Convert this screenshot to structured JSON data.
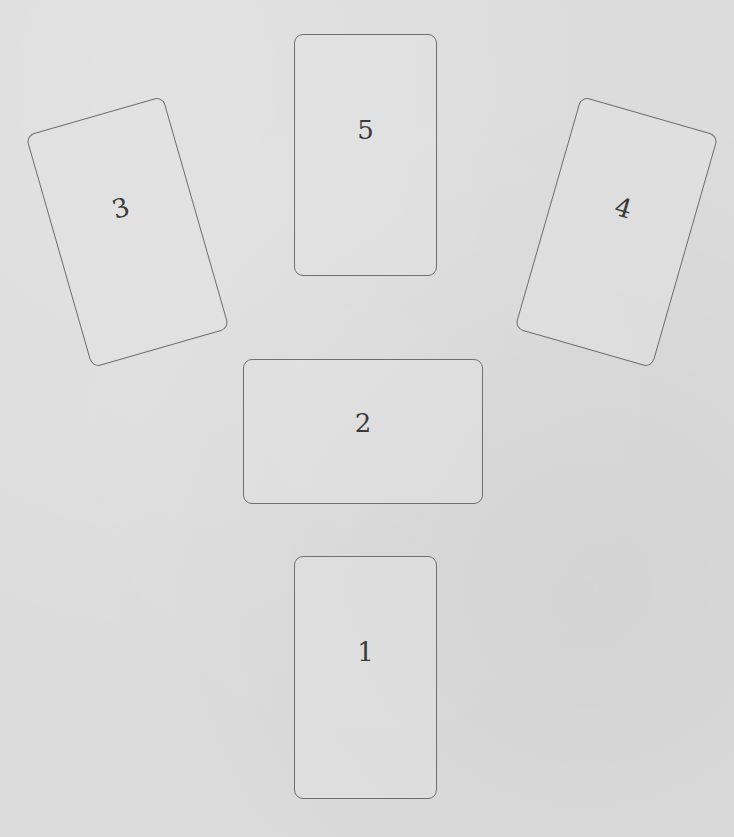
{
  "spread": {
    "cards": [
      {
        "label": "1",
        "position": "bottom-center",
        "orientation": "portrait"
      },
      {
        "label": "2",
        "position": "center",
        "orientation": "landscape"
      },
      {
        "label": "3",
        "position": "upper-left",
        "orientation": "portrait-tilted-left"
      },
      {
        "label": "4",
        "position": "upper-right",
        "orientation": "portrait-tilted-right"
      },
      {
        "label": "5",
        "position": "top-center",
        "orientation": "portrait"
      }
    ]
  },
  "colors": {
    "background": "#dcdcdc",
    "card_border": "#6f6f6f",
    "card_text": "#3a3a3a"
  }
}
